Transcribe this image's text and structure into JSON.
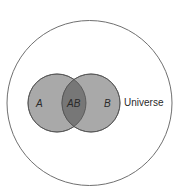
{
  "diagram": {
    "type": "venn",
    "universe_label": "Universe",
    "sets": [
      {
        "id": "A",
        "label": "A"
      },
      {
        "id": "B",
        "label": "B"
      }
    ],
    "intersection_label": "AB",
    "colors": {
      "background": "#ffffff",
      "universe_stroke": "#707070",
      "set_fill": "#a9a9a9",
      "intersection_fill": "#777777",
      "set_stroke": "#505050",
      "text": "#2a2a2a"
    }
  }
}
